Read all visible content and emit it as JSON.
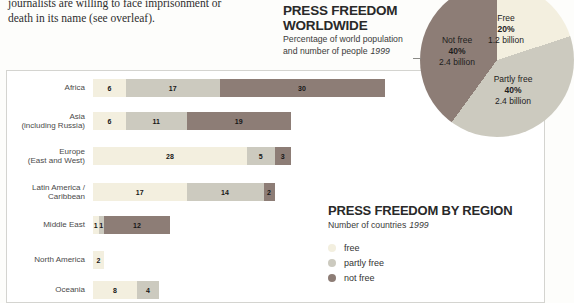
{
  "colors": {
    "free": "#f3efdf",
    "partly_free": "#cccabf",
    "not_free": "#8d7d76",
    "page_background": "#fdfdfb",
    "panel_border": "#d4d4d0"
  },
  "intro": {
    "line1": "journalists are willing to face imprisonment or",
    "line2": "death in its name (see overleaf)."
  },
  "chart_data": [
    {
      "type": "pie",
      "title_lines": [
        "PRESS FREEDOM",
        "WORLDWIDE"
      ],
      "subtitle_line1": "Percentage of world population",
      "subtitle_line2": "and number of people",
      "year": "1999",
      "labels_on_slices": true,
      "slices": [
        {
          "label": "Free",
          "percent": 20,
          "percent_label": "20%",
          "people": "1.2 billion",
          "color": "#f3efdf"
        },
        {
          "label": "Partly free",
          "percent": 40,
          "percent_label": "40%",
          "people": "2.4 billion",
          "color": "#cccabf"
        },
        {
          "label": "Not free",
          "percent": 40,
          "percent_label": "40%",
          "people": "2.4 billion",
          "color": "#8d7d76"
        }
      ]
    },
    {
      "type": "bar",
      "stacked": true,
      "orientation": "horizontal",
      "title": "PRESS FREEDOM BY REGION",
      "subtitle": "Number of countries",
      "year": "1999",
      "grid": false,
      "xlim": [
        0,
        53
      ],
      "legend_position": "below-title-right",
      "categories": [
        "Africa",
        "Asia\n(including Russia)",
        "Europe\n(East and West)",
        "Latin America /\nCaribbean",
        "Middle East",
        "North America",
        "Oceania"
      ],
      "series": [
        {
          "name": "free",
          "color": "#f3efdf",
          "values": [
            6,
            6,
            28,
            17,
            1,
            2,
            8
          ]
        },
        {
          "name": "partly free",
          "color": "#cccabf",
          "values": [
            17,
            11,
            5,
            14,
            1,
            0,
            4
          ]
        },
        {
          "name": "not free",
          "color": "#8d7d76",
          "values": [
            30,
            19,
            3,
            2,
            12,
            0,
            0
          ]
        }
      ]
    }
  ]
}
